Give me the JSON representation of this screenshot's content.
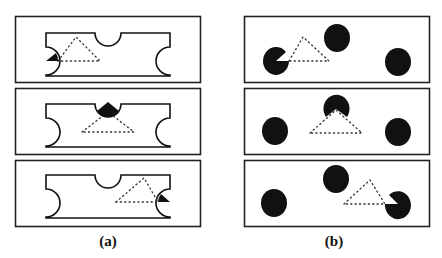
{
  "figure": {
    "panels_a_label": "(a)",
    "panels_b_label": "(b)",
    "column_a": {
      "description": "Notched template shape with dotted illusory triangle; highlighted wedge moves through three positions",
      "rows": [
        {
          "highlighted_inducer": "left"
        },
        {
          "highlighted_inducer": "top"
        },
        {
          "highlighted_inducer": "right"
        }
      ]
    },
    "column_b": {
      "description": "Three black disks with pac-man wedge cut revealing dotted triangle; cut moves through three positions",
      "rows": [
        {
          "pacman_inducer": "left"
        },
        {
          "pacman_inducer": "top"
        },
        {
          "pacman_inducer": "right"
        }
      ]
    },
    "colors": {
      "ink": "#111111",
      "background": "#ffffff"
    }
  }
}
